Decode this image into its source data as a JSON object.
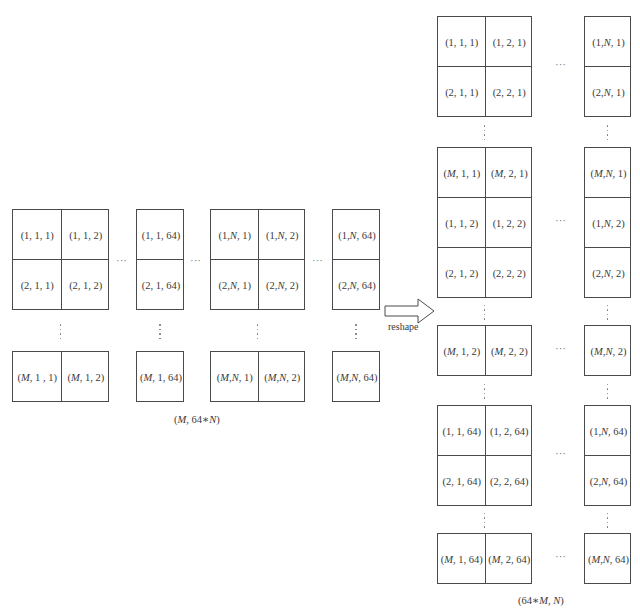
{
  "left": {
    "groups": [
      {
        "x": 12,
        "w": 97,
        "cols": 2,
        "top_rows": [
          [
            "(1, 1, 1)",
            "(1, 1, 2)"
          ],
          [
            "(2, 1, 1)",
            "(2, 1, 2)"
          ]
        ],
        "bottom_row": [
          "(M, 1 , 1)",
          "(M, 1, 2)"
        ]
      },
      {
        "x": 136,
        "w": 48,
        "cols": 1,
        "top_rows": [
          [
            "(1, 1, 64)"
          ],
          [
            "(2, 1, 64)"
          ]
        ],
        "bottom_row": [
          "(M, 1, 64)"
        ]
      },
      {
        "x": 210,
        "w": 95,
        "cols": 2,
        "top_rows": [
          [
            "(1, N, 1)",
            "(1, N, 2)"
          ],
          [
            "(2, N, 1)",
            "(2, N, 2)"
          ]
        ],
        "bottom_row": [
          "(M, N, 1)",
          "(M, N, 2)"
        ]
      },
      {
        "x": 332,
        "w": 48,
        "cols": 1,
        "top_rows": [
          [
            "(1, N, 64)"
          ],
          [
            "(2, N, 64)"
          ]
        ],
        "bottom_row": [
          "(M, N, 64)"
        ]
      }
    ],
    "ellipsis_h": "···",
    "dimension_label": "(M, 64∗N)"
  },
  "arrow": {
    "label": "reshape"
  },
  "right": {
    "blocks": [
      {
        "y": 16,
        "rows": [
          [
            "(1, 1, 1)",
            "(1, 2, 1)",
            "(1, N, 1)"
          ],
          [
            "(2, 1, 1)",
            "(2, 2, 1)",
            "(2, N, 1)"
          ]
        ]
      },
      {
        "y": 147,
        "rows": [
          [
            "(M, 1, 1)",
            "(M, 2, 1)",
            "(M, N, 1)"
          ],
          [
            "(1, 1, 2)",
            "(1, 2, 2)",
            "(1, N, 2)"
          ],
          [
            "(2, 1, 2)",
            "(2, 2, 2)",
            "(2, N, 2)"
          ]
        ]
      },
      {
        "y": 325,
        "rows": [
          [
            "(M, 1, 2)",
            "(M, 2, 2)",
            "(M, N, 2)"
          ]
        ]
      },
      {
        "y": 405,
        "rows": [
          [
            "(1, 1, 64)",
            "(1, 2, 64)",
            "(1, N, 64)"
          ],
          [
            "(2, 1, 64)",
            "(2, 2, 64)",
            "(2, N, 64)"
          ]
        ]
      },
      {
        "y": 533,
        "rows": [
          [
            "(M, 1, 64)",
            "(M, 2, 64)",
            "(M, N, 64)"
          ]
        ]
      }
    ],
    "ellipsis_h": "···",
    "dimension_label": "(64∗M, N)"
  }
}
